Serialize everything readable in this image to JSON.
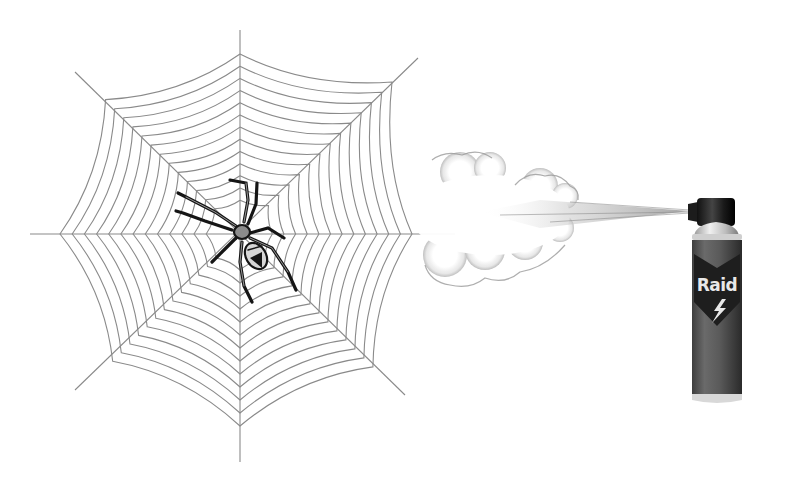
{
  "illustration": {
    "subject": "Spider on web being sprayed with insecticide",
    "web": {
      "center": [
        240,
        234
      ],
      "color": "#8a8a8a",
      "radial_count": 8,
      "ring_count": 13
    },
    "spider": {
      "color": "#1a1a1a",
      "body_color": "#8c8c8c"
    },
    "spray": {
      "cloud_color": "#d9d9d9"
    },
    "can": {
      "brand_label": "Raid",
      "body_color": "#5a5a5a",
      "cap_color": "#1c1c1c",
      "shoulder_color": "#cfcfcf",
      "label_color": "#1e1e1e",
      "lightning_icon": "lightning-bolt-icon"
    }
  }
}
